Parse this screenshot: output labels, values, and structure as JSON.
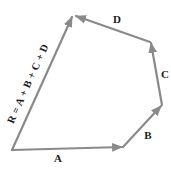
{
  "diagram": {
    "vectors": [
      {
        "name": "A",
        "label": "A"
      },
      {
        "name": "B",
        "label": "B"
      },
      {
        "name": "C",
        "label": "C"
      },
      {
        "name": "D",
        "label": "D"
      }
    ],
    "resultant": {
      "name": "R",
      "label": "R = A + B + C + D"
    },
    "colors": {
      "vector": "#8a8a8a",
      "text": "#1a1a1a",
      "background": "#ffffff"
    }
  }
}
